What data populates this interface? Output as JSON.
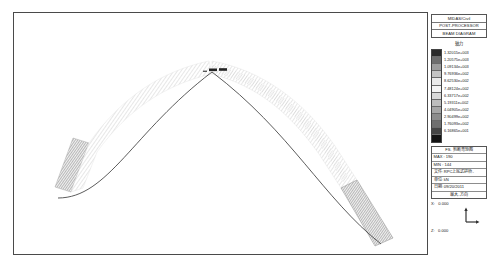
{
  "window": {
    "title": "MIDAS/Civil Post-Processor Beam Diagram"
  },
  "legend_panel": {
    "header_lines": [
      "MIDAS/Civil",
      "POST-PROCESSOR",
      "BEAM DIAGRAM"
    ],
    "scale_title": "轴力",
    "swatch_colors": [
      "#2b2b2b",
      "#6e6e6e",
      "#9d9d9d",
      "#c4c4c4",
      "#eaeaea",
      "#f4f4f4",
      "#d9d9d9",
      "#bdbdbd",
      "#a6a6a6",
      "#8c8c8c",
      "#6f6f6f",
      "#454545",
      "#141414"
    ],
    "values": [
      "1.32015e+003",
      "1.20575e+003",
      "1.09134e+003",
      "9.76936e+002",
      "8.62530e+002",
      "7.48124e+002",
      "6.33717e+002",
      "5.19311e+002",
      "4.04905e+002",
      "2.90499e+002",
      "1.76093e+002",
      "6.16865e+001"
    ]
  },
  "info_panel": {
    "caption": "FS. 剪断弯矩图",
    "max_label": "MAX",
    "max_value": "190",
    "min_label": "MIN",
    "min_value": "144",
    "file_label": "文件:",
    "file_value": "RPC上底式拱桥-",
    "unit_label": "单位:",
    "unit_value": "kN",
    "date_label": "日期:",
    "date_value": "09/20/2011",
    "view_caption": "最大-方向"
  },
  "coordinates": {
    "x_label": "X:",
    "x_value": "0.000",
    "z_label": "Z:",
    "z_value": "0.000",
    "axis_icon": "axis-indicator"
  },
  "chart_data": {
    "type": "line",
    "xlabel": "",
    "ylabel": "轴力 (kN)",
    "units": "kN",
    "legend_position": "right",
    "grid": false,
    "max": 1320.15,
    "min": 61.6865,
    "value_range": [
      61.6865,
      1320.15
    ],
    "structure": "parabolic arch rib, span normalized 0..1, rise ratio ~0.60",
    "arch_span_px": 395,
    "arch_rise_px": 108,
    "x": [
      0.0,
      0.05,
      0.1,
      0.15,
      0.2,
      0.25,
      0.3,
      0.35,
      0.4,
      0.45,
      0.5,
      0.55,
      0.6,
      0.65,
      0.7,
      0.75,
      0.8,
      0.85,
      0.9,
      0.95,
      1.0
    ],
    "series": [
      {
        "name": "轴力",
        "values": [
          1320.15,
          1180.4,
          1045.6,
          920.3,
          812.7,
          718.5,
          640.2,
          572.9,
          518.4,
          478.6,
          455.0,
          472.3,
          508.8,
          560.1,
          625.4,
          705.2,
          800.6,
          912.7,
          1040.3,
          1185.9,
          1320.15
        ]
      }
    ]
  }
}
